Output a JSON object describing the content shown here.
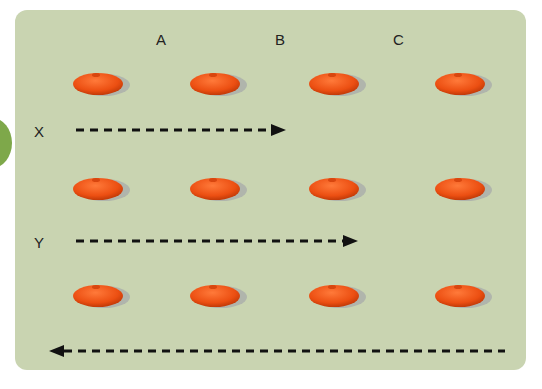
{
  "columns": [
    "A",
    "B",
    "C"
  ],
  "rows": [
    {
      "label": "X",
      "arrow_direction": "right"
    },
    {
      "label": "Y",
      "arrow_direction": "right"
    },
    {
      "label": "",
      "arrow_direction": "left"
    }
  ],
  "cone_grid": {
    "rows": 3,
    "cols": 4
  },
  "colors": {
    "panel": "#c9d4b1",
    "cone": "#f05a1e",
    "badge": "#7ea84a",
    "arrow": "#111111"
  }
}
